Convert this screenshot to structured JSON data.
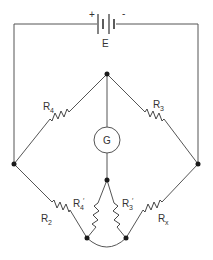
{
  "diagram": {
    "type": "circuit",
    "battery": {
      "label": "E",
      "plus": "+",
      "minus": "-"
    },
    "galvanometer": {
      "label": "G"
    },
    "resistors": [
      {
        "id": "R4",
        "main": "R",
        "sub": "4",
        "prime": ""
      },
      {
        "id": "R3",
        "main": "R",
        "sub": "3",
        "prime": ""
      },
      {
        "id": "R2",
        "main": "R",
        "sub": "2",
        "prime": ""
      },
      {
        "id": "Rx",
        "main": "R",
        "sub": "x",
        "prime": ""
      },
      {
        "id": "R4p",
        "main": "R",
        "sub": "4",
        "prime": "′"
      },
      {
        "id": "R3p",
        "main": "R",
        "sub": "3",
        "prime": "′"
      }
    ]
  }
}
